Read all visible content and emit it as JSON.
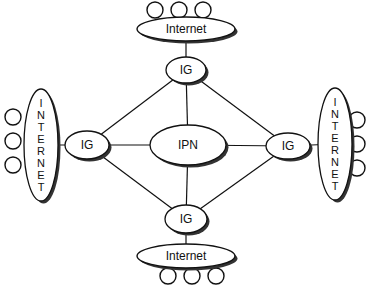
{
  "diagram": {
    "colors": {
      "stroke": "#111111",
      "shadow": "#333333",
      "fill": "#ffffff",
      "background": "#ffffff"
    },
    "nodes": {
      "internet_top": {
        "label": "Internet",
        "cx": 186,
        "cy": 29,
        "rx": 49,
        "ry": 12
      },
      "internet_bottom": {
        "label": "Internet",
        "cx": 186,
        "cy": 256,
        "rx": 49,
        "ry": 12
      },
      "internet_left": {
        "label": "INTERNET",
        "cx": 41,
        "cy": 145,
        "rx": 17,
        "ry": 56
      },
      "internet_right": {
        "label": "INTERNET",
        "cx": 335,
        "cy": 144,
        "rx": 17,
        "ry": 56
      },
      "ig_top": {
        "label": "IG",
        "cx": 186,
        "cy": 70,
        "rx": 20,
        "ry": 13
      },
      "ig_bottom": {
        "label": "IG",
        "cx": 186,
        "cy": 219,
        "rx": 21,
        "ry": 14
      },
      "ig_left": {
        "label": "IG",
        "cx": 87,
        "cy": 145,
        "rx": 22,
        "ry": 14
      },
      "ig_right": {
        "label": "IG",
        "cx": 288,
        "cy": 146,
        "rx": 22,
        "ry": 13
      },
      "ipn": {
        "label": "IPN",
        "cx": 188,
        "cy": 145,
        "rx": 38,
        "ry": 20
      }
    },
    "vertical_letters": {
      "left": [
        "I",
        "N",
        "T",
        "E",
        "R",
        "N",
        "E",
        "T"
      ],
      "right": [
        "I",
        "N",
        "T",
        "E",
        "R",
        "N",
        "E",
        "T"
      ]
    },
    "edges": [
      {
        "from": "internet_top",
        "to": "ig_top"
      },
      {
        "from": "internet_bottom",
        "to": "ig_bottom"
      },
      {
        "from": "internet_left",
        "to": "ig_left"
      },
      {
        "from": "internet_right",
        "to": "ig_right"
      },
      {
        "from": "ig_top",
        "to": "ipn"
      },
      {
        "from": "ig_bottom",
        "to": "ipn"
      },
      {
        "from": "ig_left",
        "to": "ipn"
      },
      {
        "from": "ig_right",
        "to": "ipn"
      },
      {
        "from": "ig_top",
        "to": "ig_left"
      },
      {
        "from": "ig_top",
        "to": "ig_right"
      },
      {
        "from": "ig_bottom",
        "to": "ig_left"
      },
      {
        "from": "ig_bottom",
        "to": "ig_right"
      }
    ],
    "host_circles": {
      "top": [
        {
          "cx": 155,
          "cy": 10
        },
        {
          "cx": 179,
          "cy": 10
        },
        {
          "cx": 203,
          "cy": 10
        }
      ],
      "bottom": [
        {
          "cx": 168,
          "cy": 276
        },
        {
          "cx": 192,
          "cy": 276
        },
        {
          "cx": 216,
          "cy": 276
        }
      ],
      "left": [
        {
          "cx": 13,
          "cy": 117
        },
        {
          "cx": 13,
          "cy": 141
        },
        {
          "cx": 13,
          "cy": 165
        }
      ],
      "right": [
        {
          "cx": 357,
          "cy": 120
        },
        {
          "cx": 357,
          "cy": 144
        },
        {
          "cx": 357,
          "cy": 168
        }
      ],
      "r": 8
    }
  }
}
